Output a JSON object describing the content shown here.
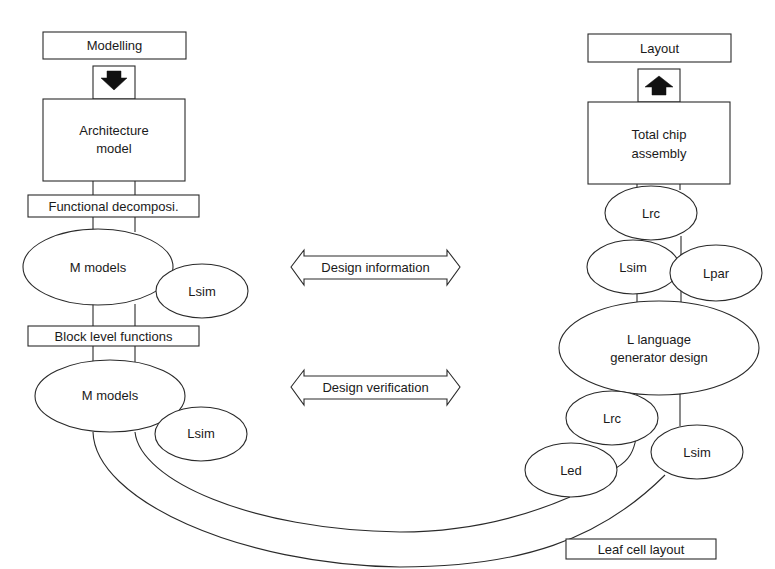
{
  "title_fragment": "",
  "left_column": {
    "modelling": "Modelling",
    "architecture_line1": "Architecture",
    "architecture_line2": "model",
    "functional": "Functional decomposi.",
    "m_models_1": "M models",
    "lsim_1": "Lsim",
    "block_level": "Block level functions",
    "m_models_2": "M models",
    "lsim_2": "Lsim"
  },
  "center": {
    "design_information": "Design information",
    "design_verification": "Design verification"
  },
  "right_column": {
    "layout": "Layout",
    "total_chip_line1": "Total chip",
    "total_chip_line2": "assembly",
    "lrc_1": "Lrc",
    "lsim_3": "Lsim",
    "lpar": "Lpar",
    "l_language_line1": "L language",
    "l_language_line2": "generator design",
    "lrc_2": "Lrc",
    "led": "Led",
    "lsim_4": "Lsim",
    "leaf_cell": "Leaf cell layout"
  },
  "icons": {
    "down_arrow": "down-arrow-icon",
    "up_arrow": "up-arrow-icon",
    "double_arrow": "double-arrow-icon"
  },
  "colors": {
    "stroke": "#2a2a2a",
    "fill": "#ffffff",
    "text": "#1a1a1a"
  }
}
